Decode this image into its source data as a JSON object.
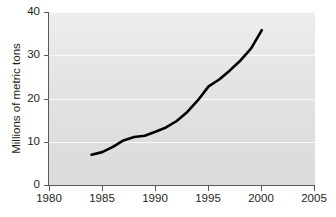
{
  "chart_data": {
    "type": "line",
    "title": "",
    "subtitle": "",
    "xlabel": "",
    "ylabel": "Millions of metric tons",
    "xlim": [
      1980,
      2005
    ],
    "ylim": [
      0,
      40
    ],
    "xticks": [
      1980,
      1985,
      1990,
      1995,
      2000,
      2005
    ],
    "xtick_labels": [
      "1980",
      "1985",
      "1990",
      "1995",
      "2000",
      "2005"
    ],
    "yticks": [
      0,
      10,
      20,
      30,
      40
    ],
    "ytick_labels": [
      "0",
      "10",
      "20",
      "30",
      "40"
    ],
    "grid": "horizontal",
    "legend": "none",
    "annotations": [],
    "series": [
      {
        "name": "Millions of metric tons",
        "color": "#000000",
        "x": [
          1984,
          1985,
          1986,
          1987,
          1988,
          1989,
          1990,
          1991,
          1992,
          1993,
          1994,
          1995,
          1996,
          1997,
          1998,
          1999,
          2000
        ],
        "values": [
          7.0,
          7.6,
          8.8,
          10.3,
          11.1,
          11.4,
          12.3,
          13.3,
          14.8,
          16.9,
          19.6,
          22.8,
          24.4,
          26.5,
          28.8,
          31.6,
          35.8
        ]
      }
    ]
  },
  "axis": {
    "y_title": "Millions of metric tons",
    "y_ticks": [
      "40",
      "30",
      "20",
      "10",
      "0"
    ],
    "x_ticks": [
      "1980",
      "1985",
      "1990",
      "1995",
      "2000",
      "2005"
    ]
  }
}
